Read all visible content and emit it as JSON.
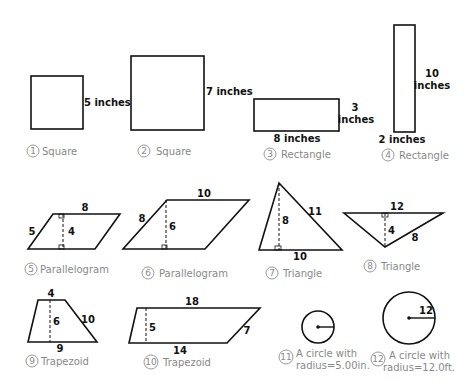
{
  "figures": [
    {
      "id": 1,
      "type": "square",
      "caption": "Square",
      "labels": {
        "side": "5 inches"
      }
    },
    {
      "id": 2,
      "type": "square",
      "caption": "Square",
      "labels": {
        "side": "7 inches"
      }
    },
    {
      "id": 3,
      "type": "rectangle",
      "caption": "Rectangle",
      "labels": {
        "height_1": "3",
        "height_2": "inches",
        "base": "8 inches"
      }
    },
    {
      "id": 4,
      "type": "rectangle",
      "caption": "Rectangle",
      "labels": {
        "height_1": "10",
        "height_2": "inches",
        "base": "2 inches"
      }
    },
    {
      "id": 5,
      "type": "parallelogram",
      "caption": "Parallelogram",
      "labels": {
        "top": "8",
        "side": "5",
        "height": "4"
      }
    },
    {
      "id": 6,
      "type": "parallelogram",
      "caption": "Parallelogram",
      "labels": {
        "top": "10",
        "side": "8",
        "height": "6"
      }
    },
    {
      "id": 7,
      "type": "triangle",
      "caption": "Triangle",
      "labels": {
        "height": "8",
        "side": "11",
        "base": "10"
      }
    },
    {
      "id": 8,
      "type": "triangle",
      "caption": "Triangle",
      "labels": {
        "top": "12",
        "height": "4",
        "side": "8"
      }
    },
    {
      "id": 9,
      "type": "trapezoid",
      "caption": "Trapezoid",
      "labels": {
        "top": "4",
        "height": "6",
        "side": "10",
        "base": "9"
      }
    },
    {
      "id": 10,
      "type": "trapezoid",
      "caption": "Trapezoid",
      "labels": {
        "top": "18",
        "height": "5",
        "side": "7",
        "base": "14"
      }
    },
    {
      "id": 11,
      "type": "circle",
      "caption_1": "A circle with",
      "caption_2": "radius=5.00in.",
      "labels": {}
    },
    {
      "id": 12,
      "type": "circle",
      "caption_1": "A circle with",
      "caption_2": "radius=12.0ft.",
      "labels": {
        "radius": "12"
      }
    }
  ],
  "numbers": [
    "1",
    "2",
    "3",
    "4",
    "5",
    "6",
    "7",
    "8",
    "9",
    "10",
    "11",
    "12"
  ]
}
